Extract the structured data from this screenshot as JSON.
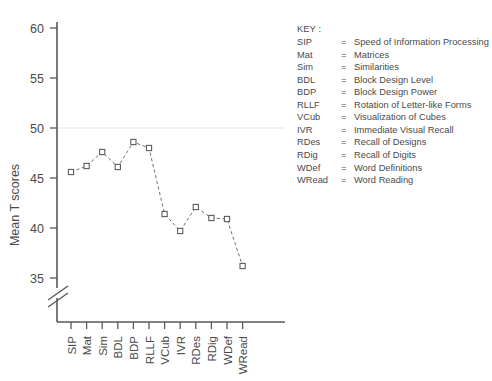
{
  "chart_data": {
    "type": "line",
    "title": "",
    "xlabel": "",
    "ylabel": "Mean T scores",
    "categories": [
      "SIP",
      "Mat",
      "Sim",
      "BDL",
      "BDP",
      "RLLF",
      "VCub",
      "IVR",
      "RDes",
      "RDig",
      "WDef",
      "WRead"
    ],
    "values": [
      45.6,
      46.2,
      47.6,
      46.1,
      48.6,
      48.0,
      41.4,
      39.7,
      42.1,
      41.0,
      40.9,
      36.2
    ],
    "ylim": [
      33.5,
      60.5
    ],
    "yticks": [
      35,
      40,
      45,
      50,
      55,
      60
    ],
    "ytick_labels": [
      "35",
      "40",
      "45",
      "50",
      "55",
      "60"
    ],
    "axis_break": true,
    "axis_break_note": "y-axis broken below 35",
    "grid": false,
    "reference_line": 50,
    "marker": "open-square",
    "linestyle": "dashed",
    "legend_position": "right-outside",
    "series_color": "#6e7072"
  },
  "key": {
    "title": "KEY :",
    "equals": "=",
    "entries": [
      {
        "abbr": "SIP",
        "desc": "Speed of Information Processing"
      },
      {
        "abbr": "Mat",
        "desc": "Matrices"
      },
      {
        "abbr": "Sim",
        "desc": "Similarities"
      },
      {
        "abbr": "BDL",
        "desc": "Block Design Level"
      },
      {
        "abbr": "BDP",
        "desc": "Block Design Power"
      },
      {
        "abbr": "RLLF",
        "desc": "Rotation of Letter-like Forms"
      },
      {
        "abbr": "VCub",
        "desc": "Visualization of Cubes"
      },
      {
        "abbr": "IVR",
        "desc": "Immediate Visual Recall"
      },
      {
        "abbr": "RDes",
        "desc": "Recall of Designs"
      },
      {
        "abbr": "RDig",
        "desc": "Recall of Digits"
      },
      {
        "abbr": "WDef",
        "desc": "Word Definitions"
      },
      {
        "abbr": "WRead",
        "desc": "Word Reading"
      }
    ]
  }
}
